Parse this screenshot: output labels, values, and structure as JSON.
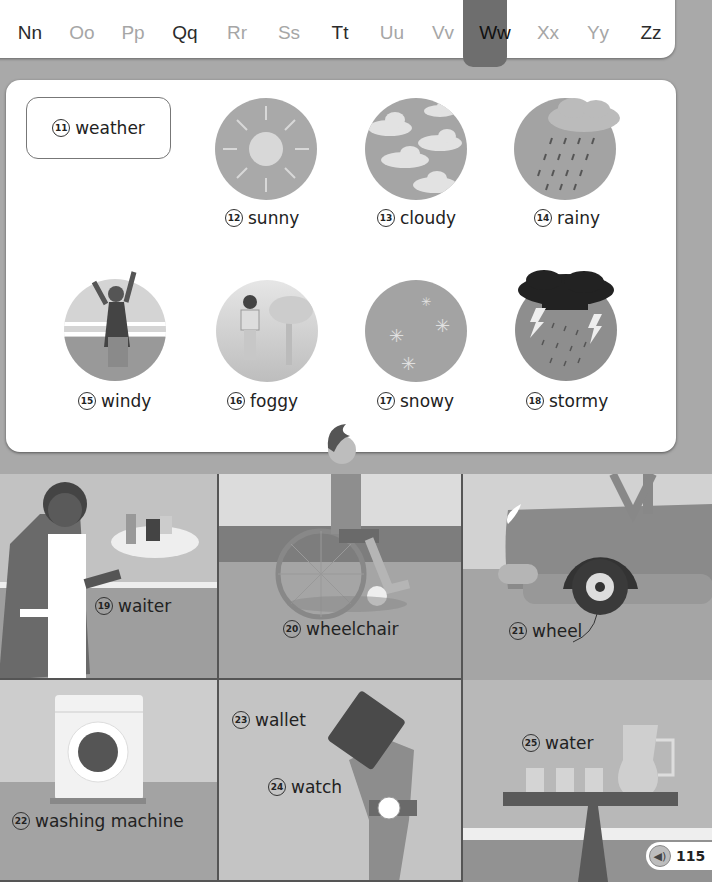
{
  "alphabet": {
    "letters": [
      {
        "label": "Nn",
        "x": 0,
        "tone": "dark"
      },
      {
        "label": "Oo",
        "x": 52,
        "tone": "light"
      },
      {
        "label": "Pp",
        "x": 103,
        "tone": "light"
      },
      {
        "label": "Qq",
        "x": 155,
        "tone": "dark"
      },
      {
        "label": "Rr",
        "x": 207,
        "tone": "light"
      },
      {
        "label": "Ss",
        "x": 259,
        "tone": "light"
      },
      {
        "label": "Tt",
        "x": 310,
        "tone": "dark"
      },
      {
        "label": "Uu",
        "x": 362,
        "tone": "light"
      },
      {
        "label": "Vv",
        "x": 413,
        "tone": "light"
      },
      {
        "label": "Ww",
        "x": 465,
        "tone": "active"
      },
      {
        "label": "Xx",
        "x": 518,
        "tone": "light"
      },
      {
        "label": "Yy",
        "x": 568,
        "tone": "light"
      },
      {
        "label": "Zz",
        "x": 621,
        "tone": "dark"
      }
    ],
    "active": "Ww"
  },
  "weather": {
    "title": {
      "num": "11",
      "word": "weather"
    },
    "items": [
      {
        "num": "12",
        "word": "sunny",
        "icon": "sun-icon"
      },
      {
        "num": "13",
        "word": "cloudy",
        "icon": "clouds-icon"
      },
      {
        "num": "14",
        "word": "rainy",
        "icon": "rain-icon"
      },
      {
        "num": "15",
        "word": "windy",
        "icon": "wind-icon"
      },
      {
        "num": "16",
        "word": "foggy",
        "icon": "fog-icon"
      },
      {
        "num": "17",
        "word": "snowy",
        "icon": "snow-icon"
      },
      {
        "num": "18",
        "word": "stormy",
        "icon": "storm-icon"
      }
    ]
  },
  "scenes": {
    "waiter": {
      "num": "19",
      "word": "waiter"
    },
    "wheelchair": {
      "num": "20",
      "word": "wheelchair"
    },
    "wheel": {
      "num": "21",
      "word": "wheel"
    },
    "washing_machine": {
      "num": "22",
      "word": "washing machine"
    },
    "wallet": {
      "num": "23",
      "word": "wallet"
    },
    "watch": {
      "num": "24",
      "word": "watch"
    },
    "water": {
      "num": "25",
      "word": "water"
    }
  },
  "footer": {
    "audio_icon": "speaker-icon",
    "page": "115"
  }
}
